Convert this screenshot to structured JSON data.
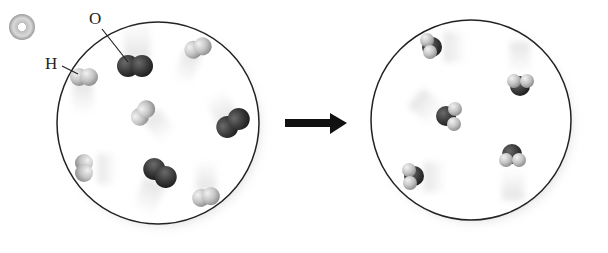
{
  "diagram": {
    "type": "reaction-particle-diagram",
    "labels": {
      "oxygen": "O",
      "hydrogen": "H"
    },
    "colors": {
      "oxygen": "#3a3a3a",
      "hydrogen": "#c8c8c8",
      "outline": "#222222",
      "arrow": "#111111"
    },
    "icons": {
      "media": "cd-icon"
    },
    "reactants": {
      "h2_count": 5,
      "o2_count": 3
    },
    "products": {
      "h2o_count": 5
    },
    "arrow": "reaction-arrow"
  }
}
